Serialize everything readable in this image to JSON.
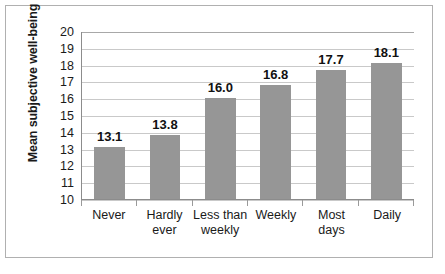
{
  "chart_data": {
    "type": "bar",
    "title": "",
    "subtitle": "",
    "xlabel": "",
    "ylabel": "Mean subjective well-being",
    "categories": [
      "Never",
      "Hardly ever",
      "Less than weekly",
      "Weekly",
      "Most days",
      "Daily"
    ],
    "category_lines": [
      [
        "Never"
      ],
      [
        "Hardly",
        "ever"
      ],
      [
        "Less than",
        "weekly"
      ],
      [
        "Weekly"
      ],
      [
        "Most",
        "days"
      ],
      [
        "Daily"
      ]
    ],
    "values": [
      13.1,
      13.8,
      16.0,
      16.8,
      17.7,
      18.1
    ],
    "value_labels": [
      "13.1",
      "13.8",
      "16.0",
      "16.8",
      "17.7",
      "18.1"
    ],
    "ylim": [
      10,
      20
    ],
    "ytick_labels": [
      "20",
      "19",
      "18",
      "17",
      "16",
      "15",
      "14",
      "13",
      "12",
      "11",
      "10"
    ],
    "yticks": [
      20,
      19,
      18,
      17,
      16,
      15,
      14,
      13,
      12,
      11,
      10
    ],
    "grid": true,
    "grid_orientation": "horizontal",
    "legend": false,
    "legend_position": "none",
    "bar_color": "#969696",
    "grid_color": "#c9c9c9",
    "axis_color": "#8c8c8c",
    "frame_color": "#b0b0b0",
    "text_color": "#1a1a1a",
    "plot_background": "#ffffff"
  }
}
